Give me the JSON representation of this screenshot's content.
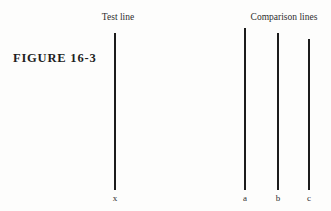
{
  "figure": {
    "caption": "FIGURE  16-3"
  },
  "test": {
    "heading": "Test line"
  },
  "comparison": {
    "heading": "Comparison lines"
  },
  "chart_data": {
    "type": "line-length-comparison",
    "title": "FIGURE 16-3",
    "groups": [
      {
        "name": "Test line",
        "lines": [
          {
            "label": "x",
            "relative_length": 157
          }
        ]
      },
      {
        "name": "Comparison lines",
        "lines": [
          {
            "label": "a",
            "relative_length": 162
          },
          {
            "label": "b",
            "relative_length": 157
          },
          {
            "label": "c",
            "relative_length": 151
          }
        ]
      }
    ]
  },
  "lines": [
    {
      "label": "x",
      "name": "test-line-x",
      "x": 115,
      "top": 33,
      "bottom": 190
    },
    {
      "label": "a",
      "name": "comparison-line-a",
      "x": 245,
      "top": 28,
      "bottom": 190
    },
    {
      "label": "b",
      "name": "comparison-line-b",
      "x": 278,
      "top": 33,
      "bottom": 190
    },
    {
      "label": "c",
      "name": "comparison-line-c",
      "x": 309,
      "top": 39,
      "bottom": 190
    }
  ],
  "colors": {
    "line": "#1c1c1c",
    "text": "#2e2e2e",
    "background": "#fdfdfc"
  }
}
